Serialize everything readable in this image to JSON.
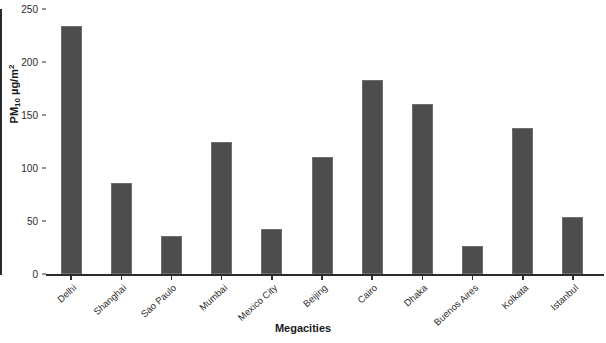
{
  "chart_data": {
    "type": "bar",
    "title": "",
    "xlabel": "Megacities",
    "ylabel": "PM10 µg/m²",
    "ylabel_parts": {
      "prefix": "PM",
      "subscript": "10",
      "unit": "µg/m",
      "superscript": "2"
    },
    "categories": [
      "Delhi",
      "Shanghai",
      "Sao Paulo",
      "Mumbai",
      "Mexico City",
      "Beijing",
      "Cairo",
      "Dhaka",
      "Buenos Aires",
      "Kolkata",
      "Istanbul"
    ],
    "values": [
      234,
      86,
      36,
      125,
      42,
      110,
      183,
      160,
      26,
      138,
      54
    ],
    "ylim": [
      0,
      250
    ],
    "yticks": [
      250,
      200,
      150,
      100,
      50,
      0
    ],
    "grid": false,
    "legend": null,
    "bar_color": "#4d4d4d",
    "bar_edge_color": "#6e6e6e",
    "axis_color": "#2b2b2b",
    "background_color": "#ffffff"
  }
}
